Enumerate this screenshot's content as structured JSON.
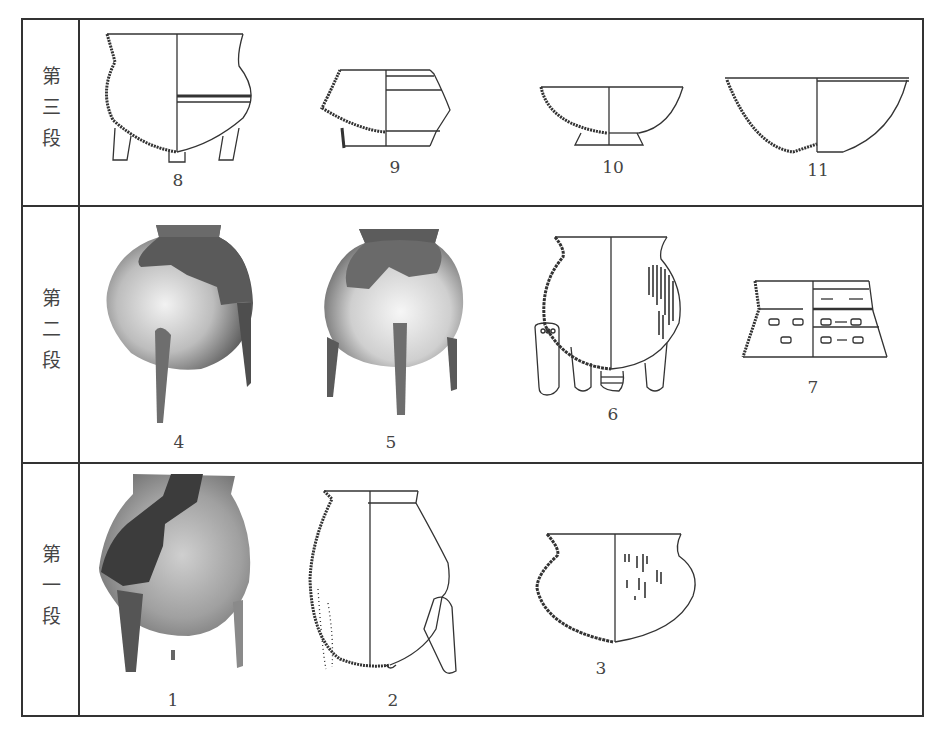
{
  "plate": {
    "rows": [
      {
        "stage": "third",
        "label": "第三段",
        "figures": [
          {
            "number": "8",
            "kind": "line-drawing",
            "vessel": "tripod jar with flared rim and incised band"
          },
          {
            "number": "9",
            "kind": "line-drawing",
            "vessel": "carinated jar"
          },
          {
            "number": "10",
            "kind": "line-drawing",
            "vessel": "ring-foot bowl"
          },
          {
            "number": "11",
            "kind": "line-drawing",
            "vessel": "round-bottom bowl"
          }
        ]
      },
      {
        "stage": "second",
        "label": "第二段",
        "figures": [
          {
            "number": "4",
            "kind": "photograph",
            "vessel": "globular tripod jar (mottled)"
          },
          {
            "number": "5",
            "kind": "photograph",
            "vessel": "globular tripod jar (mottled)"
          },
          {
            "number": "6",
            "kind": "line-drawing",
            "vessel": "tripod jar with cord-marked body and leg detail"
          },
          {
            "number": "7",
            "kind": "line-drawing",
            "vessel": "vessel fragment with rectangular impressions"
          }
        ]
      },
      {
        "stage": "first",
        "label": "第一段",
        "figures": [
          {
            "number": "1",
            "kind": "photograph",
            "vessel": "tripod jar (mottled)"
          },
          {
            "number": "2",
            "kind": "line-drawing",
            "vessel": "globular tripod jar"
          },
          {
            "number": "3",
            "kind": "line-drawing",
            "vessel": "round-bottom jar with punctate decoration"
          }
        ]
      }
    ]
  },
  "colors": {
    "ink": "#333333",
    "paper": "#ffffff",
    "photo_dark": "#555555",
    "photo_light": "#e8e8e8"
  }
}
